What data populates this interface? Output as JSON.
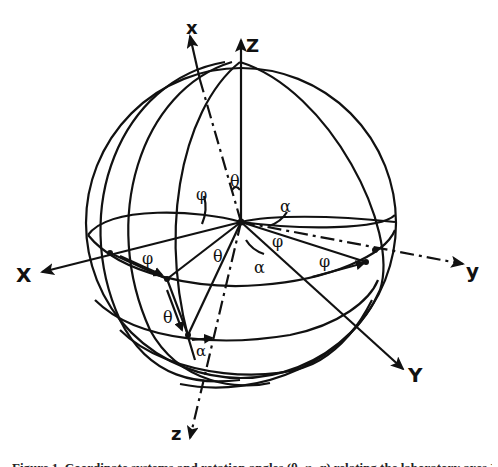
{
  "figure": {
    "type": "sphere coordinate-rotation diagram",
    "stroke_color": "#111111",
    "background": "#ffffff"
  },
  "axes": {
    "lab_fixed": [
      {
        "id": "X",
        "label": "X"
      },
      {
        "id": "Y",
        "label": "Y"
      },
      {
        "id": "Z",
        "label": "Z"
      }
    ],
    "body_rotated": [
      {
        "id": "x",
        "label": "x"
      },
      {
        "id": "y",
        "label": "y"
      },
      {
        "id": "z",
        "label": "z"
      }
    ]
  },
  "angles": {
    "theta_top": "θ",
    "phi_left": "φ",
    "alpha_right": "α",
    "phi_equator_left": "φ",
    "theta_center": "θ",
    "alpha_center": "α",
    "phi_equator_right": "φ",
    "phi_right_arrow": "φ",
    "theta_lower": "θ",
    "alpha_bottom": "α"
  },
  "caption": {
    "text": "Figure 1. Coordinate systems and rotation angles (θ, φ, α) relating the laboratory axes X, Y, Z to the body axes x, y, z."
  }
}
